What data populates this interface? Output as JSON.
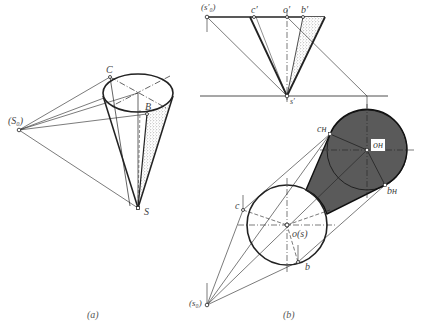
{
  "figure_a": {
    "caption": "(a)",
    "labels": {
      "light_source": "(S₀)",
      "apex": "S",
      "point_c": "C",
      "point_b": "B"
    }
  },
  "figure_b": {
    "caption": "(b)",
    "labels": {
      "light_source_front": "(s′₀)",
      "c_prime": "c′",
      "o_prime": "o′",
      "b_prime": "b′",
      "s_prime": "s′",
      "c_h": "cʜ",
      "o_h": "oʜ",
      "b_h": "bʜ",
      "point_c": "c",
      "center_os": "o(s)",
      "point_b": "b",
      "light_source_top": "(s₀)"
    }
  },
  "colors": {
    "line": "#222222",
    "shadow_fill": "#5a5a5a",
    "stipple": "#777777",
    "background": "#ffffff"
  }
}
